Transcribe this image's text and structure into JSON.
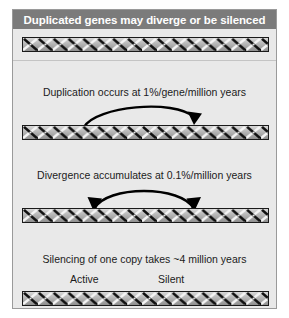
{
  "figure": {
    "title": "Duplicated genes may diverge or be silenced",
    "colors": {
      "title_bar_bg": "#7b7b7b",
      "title_text": "#ffffff",
      "panel_bg": "#e9e9e9",
      "panel_border": "#9a9a9a",
      "dna_outline": "#1a1a1a",
      "dna_bg": "#c9c9c9",
      "dna_strand_dark": "#121212",
      "dna_strand_light": "#f2f2f2",
      "arrow": "#000000",
      "body_text": "#1b1b1b",
      "divider": "#c4c4c4"
    },
    "steps": [
      {
        "dna_name": "dna-band-original",
        "caption": null,
        "arrow": null
      },
      {
        "dna_name": "dna-band-duplicated",
        "caption": "Duplication occurs at 1%/gene/million years",
        "arrow": "single-headed-right"
      },
      {
        "dna_name": "dna-band-diverged",
        "caption": "Divergence accumulates at 0.1%/million years",
        "arrow": "double-headed"
      },
      {
        "dna_name": "dna-band-silenced",
        "caption": "Silencing of one copy takes ~4 million years",
        "arrow": null
      }
    ],
    "state_labels": {
      "active": "Active",
      "silent": "Silent"
    }
  }
}
